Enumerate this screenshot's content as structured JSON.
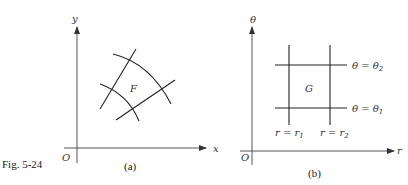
{
  "figure": {
    "caption": "Fig. 5-24",
    "panel_a": {
      "label": "(a)",
      "origin": "O",
      "x_axis": "x",
      "y_axis": "y",
      "region": "F"
    },
    "panel_b": {
      "label": "(b)",
      "origin": "O",
      "x_axis": "r",
      "y_axis": "θ",
      "region": "G",
      "lines": {
        "theta2": "θ = θ",
        "theta2_sub": "2",
        "theta1": "θ = θ",
        "theta1_sub": "1",
        "r1": "r = r",
        "r1_sub": "1",
        "r2": "r = r",
        "r2_sub": "2"
      }
    }
  }
}
